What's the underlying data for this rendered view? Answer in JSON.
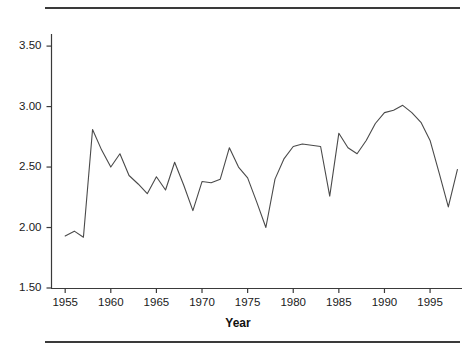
{
  "figure": {
    "background": "#ffffff",
    "line_color": "#4a4a4a",
    "axis_color": "#3a3a3a",
    "rule_top": "horizontal-rule",
    "rule_bottom": "horizontal-rule"
  },
  "chart_data": {
    "type": "line",
    "title": "",
    "xlabel": "Year",
    "ylabel": "",
    "xlim": [
      1953.5,
      1998.5
    ],
    "ylim": [
      1.5,
      3.6
    ],
    "grid": false,
    "legend": null,
    "yticks": [
      "1.50",
      "2.00",
      "2.50",
      "3.00",
      "3.50"
    ],
    "ytick_values": [
      1.5,
      2.0,
      2.5,
      3.0,
      3.5
    ],
    "xticks": [
      "1955",
      "1960",
      "1965",
      "1970",
      "1975",
      "1980",
      "1985",
      "1990",
      "1995"
    ],
    "xtick_values": [
      1955,
      1960,
      1965,
      1970,
      1975,
      1980,
      1985,
      1990,
      1995
    ],
    "series": [
      {
        "name": "value",
        "x": [
          1955,
          1956,
          1957,
          1958,
          1959,
          1960,
          1961,
          1962,
          1963,
          1964,
          1965,
          1966,
          1967,
          1968,
          1969,
          1970,
          1971,
          1972,
          1973,
          1974,
          1975,
          1976,
          1977,
          1978,
          1979,
          1980,
          1981,
          1982,
          1983,
          1984,
          1985,
          1986,
          1987,
          1988,
          1989,
          1990,
          1991,
          1992,
          1993,
          1994,
          1995,
          1996,
          1997,
          1998
        ],
        "values": [
          1.93,
          1.97,
          1.92,
          2.81,
          2.64,
          2.5,
          2.61,
          2.43,
          2.36,
          2.28,
          2.42,
          2.31,
          2.54,
          2.35,
          2.14,
          2.38,
          2.37,
          2.4,
          2.66,
          2.5,
          2.41,
          2.21,
          2.0,
          2.4,
          2.57,
          2.67,
          2.69,
          2.68,
          2.67,
          2.26,
          2.78,
          2.66,
          2.61,
          2.72,
          2.86,
          2.95,
          2.97,
          3.01,
          2.95,
          2.87,
          2.72,
          2.45,
          2.17,
          2.48
        ]
      }
    ]
  }
}
